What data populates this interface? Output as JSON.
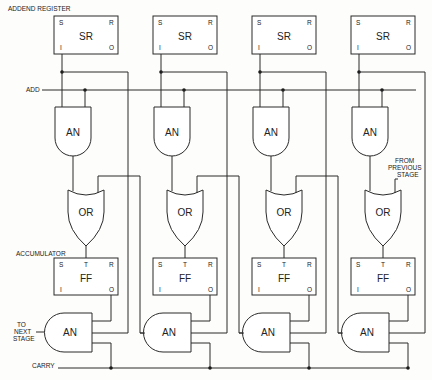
{
  "figure": {
    "labels": {
      "addend_register": "ADDEND REGISTER",
      "add": "ADD",
      "accumulator": "ACCUMULATOR",
      "to_next_stage": [
        "TO",
        "NEXT",
        "STAGE"
      ],
      "carry": "CARRY",
      "from_previous_stage": [
        "FROM",
        "PREVIOUS",
        "STAGE"
      ]
    },
    "stages": [
      {
        "register": {
          "name": "SR",
          "pins": [
            "S",
            "R",
            "I",
            "O"
          ]
        },
        "and_top": "AN",
        "or": "OR",
        "ff": {
          "name": "FF",
          "pins": [
            "S",
            "T",
            "R",
            "I",
            "O"
          ]
        },
        "and_bottom": "AN"
      },
      {
        "register": {
          "name": "SR",
          "pins": [
            "S",
            "R",
            "I",
            "O"
          ]
        },
        "and_top": "AN",
        "or": "OR",
        "ff": {
          "name": "FF",
          "pins": [
            "S",
            "T",
            "R",
            "I",
            "O"
          ]
        },
        "and_bottom": "AN"
      },
      {
        "register": {
          "name": "SR",
          "pins": [
            "S",
            "R",
            "I",
            "O"
          ]
        },
        "and_top": "AN",
        "or": "OR",
        "ff": {
          "name": "FF",
          "pins": [
            "S",
            "T",
            "R",
            "I",
            "O"
          ]
        },
        "and_bottom": "AN"
      },
      {
        "register": {
          "name": "SR",
          "pins": [
            "S",
            "R",
            "I",
            "O"
          ]
        },
        "and_top": "AN",
        "or": "OR",
        "ff": {
          "name": "FF",
          "pins": [
            "S",
            "T",
            "R",
            "I",
            "O"
          ]
        },
        "and_bottom": "AN"
      }
    ],
    "colors": {
      "line": "#2a2a2a",
      "background": "#fdfdfb"
    }
  }
}
